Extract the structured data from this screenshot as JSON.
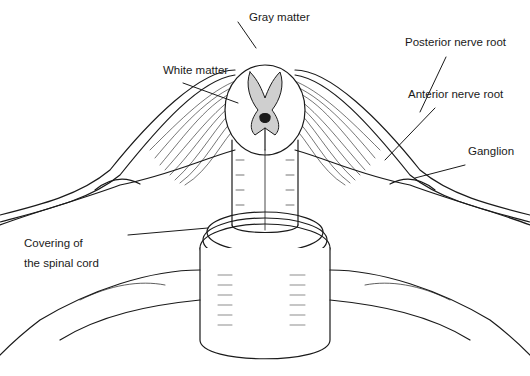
{
  "diagram": {
    "labels": {
      "gray_matter": "Gray matter",
      "white_matter": "White matter",
      "posterior_nerve_root": "Posterior nerve root",
      "anterior_nerve_root": "Anterior nerve root",
      "ganglion": "Ganglion",
      "covering_line1": "Covering of",
      "covering_line2": "the spinal cord"
    },
    "colors": {
      "ink": "#1a1a1a",
      "background": "#ffffff"
    }
  }
}
